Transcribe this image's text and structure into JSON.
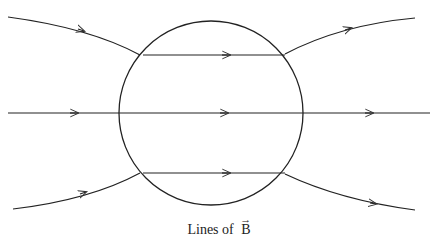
{
  "diagram": {
    "caption": {
      "prefix": "Lines of",
      "symbol": "B",
      "vector_arrow": "→"
    },
    "elements": {
      "sphere": "circle",
      "field_lines": 5,
      "description": "Magnetic field lines through a sphere: uniform horizontal lines inside, diverging outside"
    },
    "colors": {
      "line": "#222222",
      "background": "#ffffff"
    }
  }
}
